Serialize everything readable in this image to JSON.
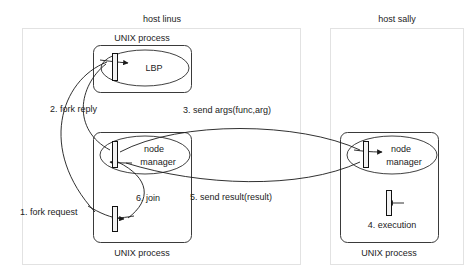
{
  "diagram": {
    "hosts": [
      {
        "id": "linus",
        "label": "host linus"
      },
      {
        "id": "sally",
        "label": "host sally"
      }
    ],
    "processes": [
      {
        "id": "linus-lbp",
        "label": "UNIX process",
        "host": "linus"
      },
      {
        "id": "linus-nm",
        "label": "UNIX process",
        "host": "linus"
      },
      {
        "id": "sally-nm",
        "label": "UNIX process",
        "host": "sally"
      }
    ],
    "components": [
      {
        "id": "lbp",
        "label": "LBP",
        "host": "linus"
      },
      {
        "id": "linus-node-manager",
        "label_line1": "node",
        "label_line2": "manager",
        "host": "linus"
      },
      {
        "id": "sally-node-manager",
        "label_line1": "node",
        "label_line2": "manager",
        "host": "sally"
      }
    ],
    "messages": [
      {
        "step": 1,
        "label": "1. fork request",
        "from": "linus-lbp",
        "to": "linus-node-manager"
      },
      {
        "step": 2,
        "label": "2. fork reply",
        "from": "linus-node-manager",
        "to": "linus-lbp"
      },
      {
        "step": 3,
        "label": "3. send args(func,arg)",
        "from": "linus-node-manager",
        "to": "sally-node-manager"
      },
      {
        "step": 4,
        "label": "4. execution",
        "from": "sally-node-manager",
        "to": "sally-node-manager"
      },
      {
        "step": 5,
        "label": "5. send result(result)",
        "from": "sally-node-manager",
        "to": "linus-node-manager"
      },
      {
        "step": 6,
        "label": "6. join",
        "from": "linus-node-manager",
        "to": "linus-lbp"
      }
    ],
    "colors": {
      "line": "#1a1a1a",
      "host_border": "#e2e2e2",
      "process_border": "#3a3a3a",
      "bar_fill": "#f2f2f2",
      "text": "#222222",
      "background": "#ffffff"
    }
  }
}
